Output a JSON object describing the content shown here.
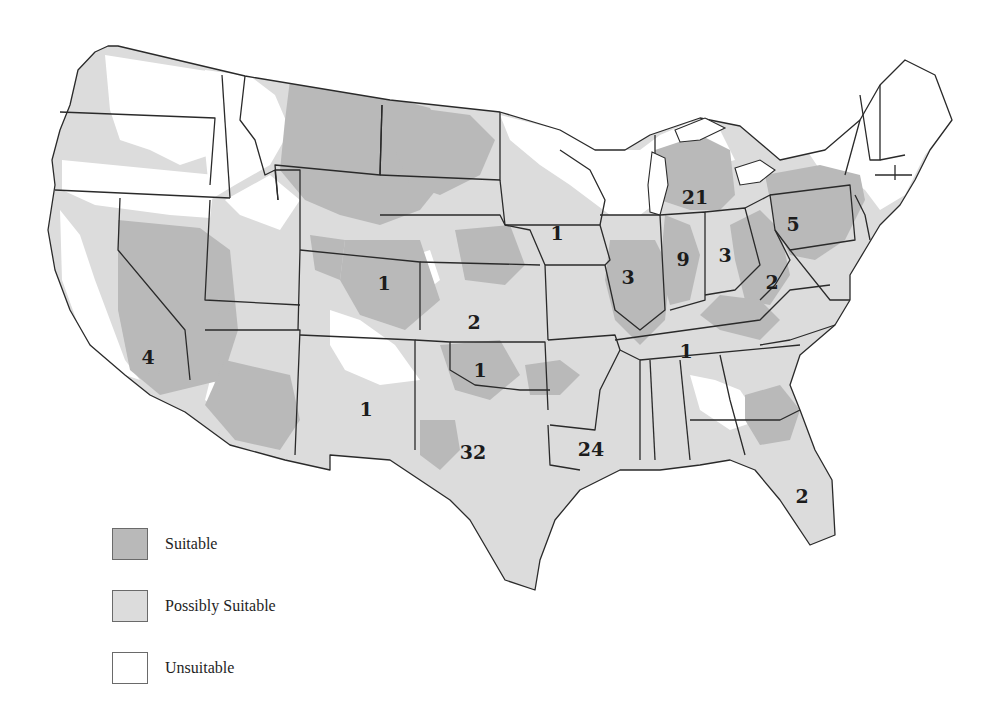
{
  "colors": {
    "suitable": "#b9b9b9",
    "possibly_suitable": "#dcdcdc",
    "unsuitable": "#ffffff",
    "border": "#2a2a2a"
  },
  "legend": [
    {
      "label": "Suitable",
      "category": "suitable"
    },
    {
      "label": "Possibly Suitable",
      "category": "possibly_suitable"
    },
    {
      "label": "Unsuitable",
      "category": "unsuitable"
    }
  ],
  "state_counts": [
    {
      "state": "California",
      "value": "4",
      "x": 148,
      "y": 357
    },
    {
      "state": "Colorado",
      "value": "1",
      "x": 384,
      "y": 283
    },
    {
      "state": "New Mexico",
      "value": "1",
      "x": 366,
      "y": 409
    },
    {
      "state": "Kansas",
      "value": "2",
      "x": 474,
      "y": 322
    },
    {
      "state": "Oklahoma",
      "value": "1",
      "x": 480,
      "y": 370
    },
    {
      "state": "Texas",
      "value": "32",
      "x": 473,
      "y": 452
    },
    {
      "state": "Iowa",
      "value": "1",
      "x": 557,
      "y": 233
    },
    {
      "state": "Louisiana",
      "value": "24",
      "x": 591,
      "y": 449
    },
    {
      "state": "Illinois",
      "value": "3",
      "x": 628,
      "y": 277
    },
    {
      "state": "Indiana",
      "value": "9",
      "x": 683,
      "y": 259
    },
    {
      "state": "Michigan",
      "value": "21",
      "x": 695,
      "y": 197
    },
    {
      "state": "Ohio",
      "value": "3",
      "x": 725,
      "y": 255
    },
    {
      "state": "West Virginia",
      "value": "2",
      "x": 772,
      "y": 282
    },
    {
      "state": "Pennsylvania",
      "value": "5",
      "x": 793,
      "y": 224
    },
    {
      "state": "Tennessee",
      "value": "1",
      "x": 686,
      "y": 351
    },
    {
      "state": "Florida",
      "value": "2",
      "x": 802,
      "y": 496
    }
  ]
}
